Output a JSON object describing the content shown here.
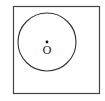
{
  "diagram": {
    "type": "geometry",
    "square": {
      "x": 13.5,
      "y": 6.5,
      "width": 86,
      "height": 87,
      "stroke": "#444444"
    },
    "circle": {
      "cx": 47,
      "cy": 42,
      "r": 29,
      "stroke": "#333333"
    },
    "center_point": {
      "x": 47,
      "y": 42,
      "label": "O"
    },
    "colors": {
      "stroke": "#333333",
      "background": "#ffffff"
    }
  }
}
